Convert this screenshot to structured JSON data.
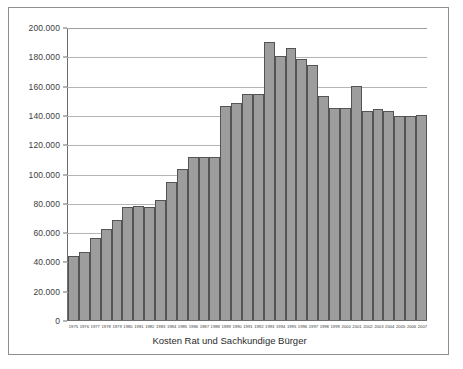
{
  "chart_data": {
    "type": "bar",
    "title": "",
    "xlabel": "Kosten Rat und Sachkundige Bürger",
    "ylabel": "",
    "ylim": [
      0,
      200000
    ],
    "ytick_step": 20000,
    "grid": true,
    "legend": null,
    "bar_color": "#9d9d9d",
    "bar_border_color": "#545454",
    "ytick_labels": [
      "200.000",
      "180.000",
      "160.000",
      "140.000",
      "120.000",
      "100.000",
      "80.000",
      "60.000",
      "40.000",
      "20.000",
      "0"
    ],
    "ytick_values": [
      200000,
      180000,
      160000,
      140000,
      120000,
      100000,
      80000,
      60000,
      40000,
      20000,
      0
    ],
    "categories": [
      "1975",
      "1976",
      "1977",
      "1978",
      "1979",
      "1980",
      "1981",
      "1982",
      "1983",
      "1984",
      "1985",
      "1986",
      "1987",
      "1988",
      "1989",
      "1990",
      "1991",
      "1992",
      "1993",
      "1994",
      "1995",
      "1996",
      "1997",
      "1998",
      "1999",
      "2000",
      "2001",
      "2002",
      "2003",
      "2004",
      "2005",
      "2006",
      "2007"
    ],
    "values": [
      44000,
      46500,
      56000,
      62000,
      68000,
      77000,
      77500,
      77000,
      82000,
      94000,
      103000,
      111000,
      111000,
      111000,
      146000,
      148000,
      154000,
      154000,
      190000,
      180000,
      186000,
      178000,
      174000,
      153000,
      145000,
      145000,
      160000,
      143000,
      144000,
      143000,
      139000,
      139000,
      140000
    ]
  }
}
